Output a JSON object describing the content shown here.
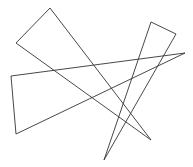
{
  "canvas": {
    "width": 193,
    "height": 167,
    "background": "#ffffff"
  },
  "stroke": {
    "color": "#333333",
    "width": 0.9
  },
  "shapes": [
    {
      "name": "triangle-upper-left",
      "points": "50,8 16,43 151,140"
    },
    {
      "name": "triangle-long-horizontal",
      "points": "11,76 16,134 185,53"
    },
    {
      "name": "triangle-tall-right",
      "points": "151,22 176,34 104,160"
    }
  ]
}
